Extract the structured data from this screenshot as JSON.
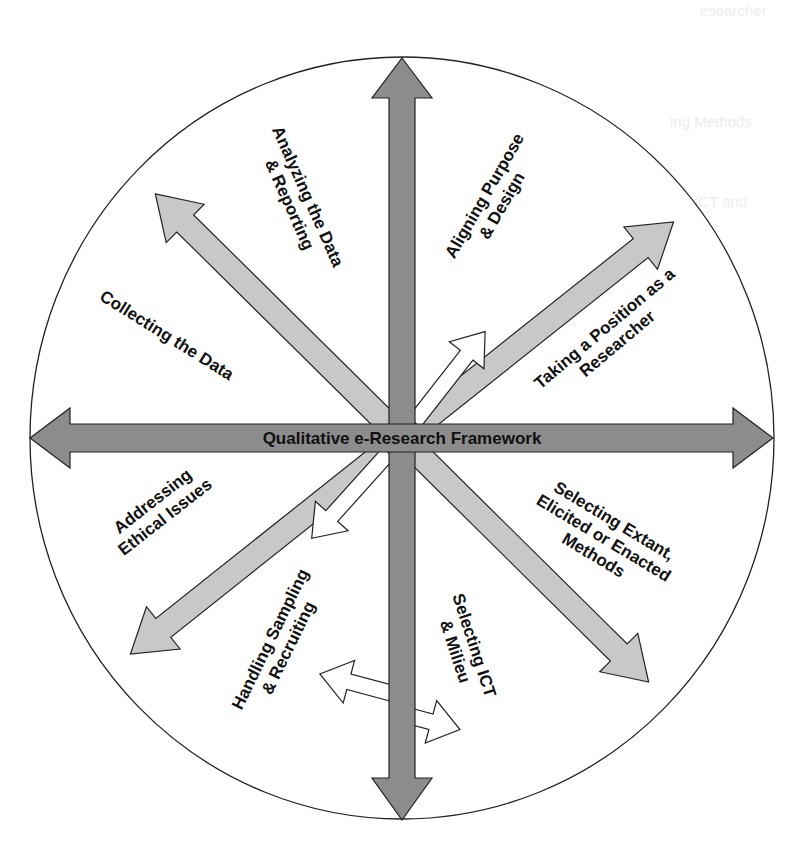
{
  "diagram": {
    "title": "Qualitative e-Research Framework",
    "colors": {
      "main_axis": "#8c8c8c",
      "diagonal": "#c8c8c8",
      "small_arrow": "#ffffff",
      "outline": "#222222",
      "background": "#ffffff",
      "text": "#111111"
    },
    "segments": [
      {
        "id": "analyzing",
        "lines": [
          "Analyzing the Data",
          "& Reporting"
        ]
      },
      {
        "id": "aligning",
        "lines": [
          "Aligning Purpose",
          "& Design"
        ]
      },
      {
        "id": "position",
        "lines": [
          "Taking a Position as a",
          "Researcher"
        ]
      },
      {
        "id": "methods",
        "lines": [
          "Selecting Extant,",
          "Elicited or Enacted",
          "Methods"
        ]
      },
      {
        "id": "ict",
        "lines": [
          "Selecting ICT",
          "& Milieu"
        ]
      },
      {
        "id": "sampling",
        "lines": [
          "Handling Sampling",
          "& Recruiting"
        ]
      },
      {
        "id": "ethics",
        "lines": [
          "Addressing",
          "Ethical Issues"
        ]
      },
      {
        "id": "collecting",
        "lines": [
          "Collecting the Data"
        ]
      }
    ]
  },
  "background_ghost_text": [
    {
      "text": "esearcher",
      "x": 700,
      "y": 2
    },
    {
      "text": "ing Methods",
      "x": 670,
      "y": 113
    },
    {
      "text": "ing ICT and",
      "x": 670,
      "y": 193
    },
    {
      "text": "ing Sampling",
      "x": 650,
      "y": 355
    },
    {
      "text": "ing Ethical",
      "x": 680,
      "y": 468
    },
    {
      "text": "ing the Data",
      "x": 660,
      "y": 540
    }
  ]
}
